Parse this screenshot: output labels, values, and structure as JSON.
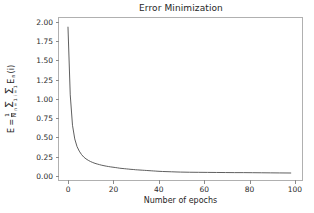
{
  "chart_data": {
    "type": "line",
    "title": "Error Minimization",
    "xlabel": "Number of epochs",
    "ylabel_parts": {
      "lhs": "E =",
      "frac_num": "1",
      "frac_den": "N",
      "sigma1_upper": "",
      "sigma1_lower": "n = 1",
      "sigma2_upper": "",
      "sigma2_lower": "i = 1",
      "term": "E",
      "term_sub": "n",
      "term_arg": "(i)"
    },
    "ylabel_plain": "E = 1/N Σ n=1 Σ i=1 En(i)",
    "xlim": [
      -4,
      104
    ],
    "ylim": [
      -0.08,
      2.05
    ],
    "xticks": [
      0,
      20,
      40,
      60,
      80,
      100
    ],
    "yticks": [
      0.0,
      0.25,
      0.5,
      0.75,
      1.0,
      1.25,
      1.5,
      1.75,
      2.0
    ],
    "ytick_labels": [
      "0.00",
      "0.25",
      "0.50",
      "0.75",
      "1.00",
      "1.25",
      "1.50",
      "1.75",
      "2.00"
    ],
    "xtick_labels": [
      "0",
      "20",
      "40",
      "60",
      "80",
      "100"
    ],
    "grid": false,
    "legend": false,
    "line_color": "#4d4d4d",
    "line_width": 0.9,
    "series": [
      {
        "name": "training error",
        "x": [
          0,
          1,
          2,
          3,
          4,
          5,
          6,
          7,
          8,
          9,
          10,
          11,
          12,
          13,
          14,
          15,
          16,
          17,
          18,
          19,
          20,
          21,
          22,
          23,
          24,
          25,
          26,
          27,
          28,
          29,
          30,
          31,
          32,
          33,
          34,
          35,
          36,
          37,
          38,
          39,
          40,
          42,
          44,
          46,
          48,
          50,
          54,
          58,
          62,
          66,
          70,
          74,
          78,
          82,
          86,
          90,
          94,
          99
        ],
        "y": [
          1.93,
          1.04,
          0.64,
          0.46,
          0.36,
          0.3,
          0.255,
          0.222,
          0.198,
          0.179,
          0.163,
          0.15,
          0.139,
          0.13,
          0.122,
          0.114,
          0.108,
          0.102,
          0.097,
          0.092,
          0.088,
          0.084,
          0.08,
          0.075,
          0.072,
          0.069,
          0.066,
          0.063,
          0.06,
          0.058,
          0.055,
          0.053,
          0.051,
          0.049,
          0.047,
          0.045,
          0.043,
          0.041,
          0.039,
          0.037,
          0.035,
          0.032,
          0.03,
          0.028,
          0.026,
          0.024,
          0.022,
          0.021,
          0.02,
          0.019,
          0.018,
          0.017,
          0.017,
          0.016,
          0.015,
          0.014,
          0.013,
          0.012
        ]
      }
    ]
  }
}
